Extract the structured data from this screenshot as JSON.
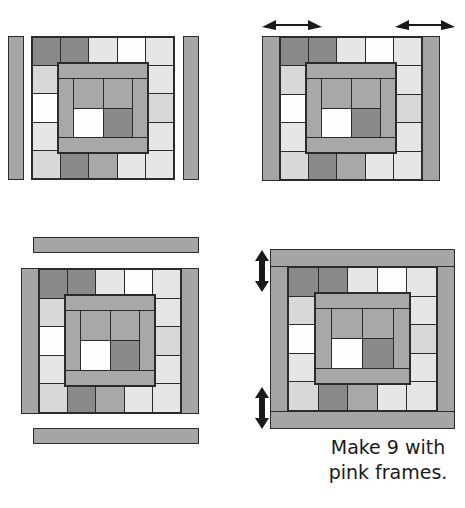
{
  "diagram": {
    "caption": "Make 9 with\npink frames.",
    "palette": {
      "dark_gray": "#8a8a8a",
      "medium_gray": "#a8a8a8",
      "light_gray": "#d8d8d8",
      "pale_gray": "#e6e6e6",
      "white": "#fdfdfd",
      "frame_pink": "#a5a5a5",
      "outline": "#2b2b2b",
      "text": "#1a1a1a",
      "background": "#ffffff"
    },
    "block": {
      "rows": 5,
      "cols": 5,
      "outer_cells": [
        [
          "dark_gray",
          "dark_gray",
          "pale_gray",
          "white",
          "pale_gray"
        ],
        [
          "light_gray",
          "",
          "",
          "",
          "pale_gray"
        ],
        [
          "white",
          "",
          "",
          "",
          "light_gray"
        ],
        [
          "pale_gray",
          "",
          "",
          "",
          "pale_gray"
        ],
        [
          "light_gray",
          "dark_gray",
          "medium_gray",
          "pale_gray",
          "pale_gray"
        ]
      ],
      "inner_frame": {
        "top": "medium_gray",
        "bottom": "medium_gray",
        "left": "medium_gray",
        "right": "medium_gray",
        "center": [
          [
            "medium_gray",
            "medium_gray"
          ],
          [
            "white",
            "dark_gray"
          ]
        ]
      }
    },
    "steps": [
      {
        "id": "step-1",
        "name": "side-strips-unattached",
        "label": "",
        "strips": [
          "left-vertical",
          "right-vertical"
        ],
        "arrows": []
      },
      {
        "id": "step-2",
        "name": "side-strips-attached",
        "label": "",
        "strips": [
          "left-vertical-attached",
          "right-vertical-attached"
        ],
        "arrows": [
          "horizontal-double",
          "horizontal-double"
        ]
      },
      {
        "id": "step-3",
        "name": "top-bottom-strips-unattached",
        "label": "",
        "strips": [
          "top-horizontal",
          "bottom-horizontal"
        ],
        "arrows": []
      },
      {
        "id": "step-4",
        "name": "full-frame-complete",
        "label": "",
        "strips": [
          "top-horizontal-attached",
          "bottom-horizontal-attached"
        ],
        "arrows": [
          "vertical-double",
          "vertical-double"
        ]
      }
    ]
  }
}
